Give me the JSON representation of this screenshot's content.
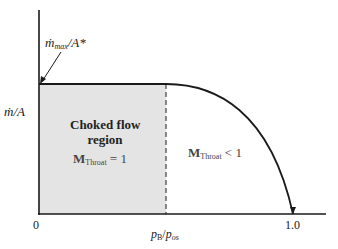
{
  "diagram": {
    "y_axis_label": {
      "main": "ṁ",
      "rest": "/A"
    },
    "annotation": {
      "main": "ṁ",
      "sub": "max",
      "rest": "/A*"
    },
    "region_left": {
      "line1": "Choked flow",
      "line2": "region",
      "mach_main": "M",
      "mach_sub": "Throat",
      "mach_rel": " = 1"
    },
    "region_right": {
      "mach_main": "M",
      "mach_sub": "Throat",
      "mach_rel": " < 1"
    },
    "x_axis_label": {
      "p1": "p",
      "s1": "B",
      "slash": "/",
      "p2": "p",
      "s2": "os"
    },
    "x_tick_zero": "0",
    "x_tick_one": "1.0",
    "colors": {
      "shade": "#e4e4e4",
      "line": "#1a1a1a"
    }
  }
}
